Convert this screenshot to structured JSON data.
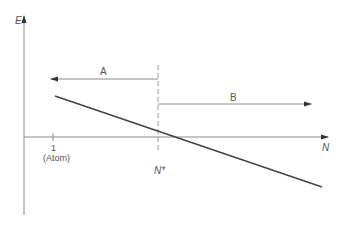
{
  "diagram": {
    "axes": {
      "y_label": "E",
      "x_label": "N"
    },
    "tick": {
      "value": "1",
      "note": "(Atom)"
    },
    "critical_point": {
      "label": "N*"
    },
    "regions": [
      {
        "label": "A",
        "direction": "left"
      },
      {
        "label": "B",
        "direction": "right"
      }
    ],
    "colors": {
      "axis": "#8a8a8a",
      "line": "#444444",
      "text": "#555555"
    }
  }
}
